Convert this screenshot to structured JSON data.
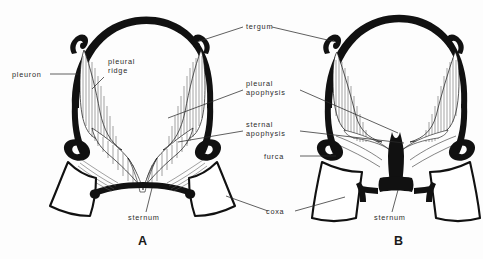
{
  "figure": {
    "kind": "anatomical-line-diagram",
    "background_color": "#fdfdfd",
    "ink_color": "#111111",
    "label_color": "#2b2b2b"
  },
  "labels": {
    "pleuron": "pleuron",
    "pleural_ridge": "pleural\nridge",
    "tergum": "tergum",
    "pleural_apophysis": "pleural\napophysis",
    "sternal_apophysis": "sternal\napophysis",
    "furca": "furca",
    "sternum_a": "sternum",
    "sternum_b": "sternum",
    "coxa": "coxa"
  },
  "captions": {
    "panel_a": "A",
    "panel_b": "B"
  }
}
